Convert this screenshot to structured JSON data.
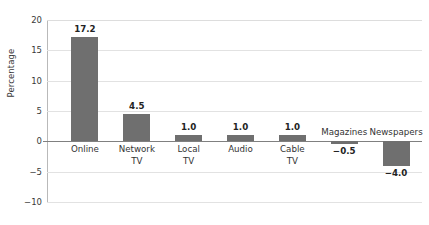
{
  "chart_data": {
    "type": "bar",
    "title": "",
    "xlabel": "",
    "ylabel": "Percentage",
    "ylim": [
      -10,
      20
    ],
    "yticks": [
      20,
      15,
      10,
      5,
      0,
      -5,
      -10
    ],
    "ytick_labels": [
      "20",
      "15",
      "10",
      "5",
      "0",
      "−5",
      "−10"
    ],
    "grid": true,
    "legend": false,
    "bar_color": "#6f6f6f",
    "categories": [
      "Online",
      "Network TV",
      "Local TV",
      "Audio",
      "Cable TV",
      "Magazines",
      "Newspapers"
    ],
    "values": [
      17.2,
      4.5,
      1.0,
      1.0,
      1.0,
      -0.5,
      -4.0
    ],
    "value_labels": [
      "17.2",
      "4.5",
      "1.0",
      "1.0",
      "1.0",
      "−0.5",
      "−4.0"
    ],
    "category_lines": [
      [
        "Online"
      ],
      [
        "Network",
        "TV"
      ],
      [
        "Local",
        "TV"
      ],
      [
        "Audio"
      ],
      [
        "Cable",
        "TV"
      ],
      [
        "Magazines"
      ],
      [
        "Newspapers"
      ]
    ],
    "bars": [
      {
        "category": "Online",
        "label_text": "Online",
        "value": 17.2,
        "value_label": "17.2",
        "sign": "positive"
      },
      {
        "category": "Network TV",
        "label_text": "Network\nTV",
        "value": 4.5,
        "value_label": "4.5",
        "sign": "positive"
      },
      {
        "category": "Local TV",
        "label_text": "Local\nTV",
        "value": 1.0,
        "value_label": "1.0",
        "sign": "positive"
      },
      {
        "category": "Audio",
        "label_text": "Audio",
        "value": 1.0,
        "value_label": "1.0",
        "sign": "positive"
      },
      {
        "category": "Cable TV",
        "label_text": "Cable\nTV",
        "value": 1.0,
        "value_label": "1.0",
        "sign": "positive"
      },
      {
        "category": "Magazines",
        "label_text": "Magazines",
        "value": -0.5,
        "value_label": "−0.5",
        "sign": "negative"
      },
      {
        "category": "Newspapers",
        "label_text": "Newspapers",
        "value": -4.0,
        "value_label": "−4.0",
        "sign": "negative"
      }
    ]
  }
}
